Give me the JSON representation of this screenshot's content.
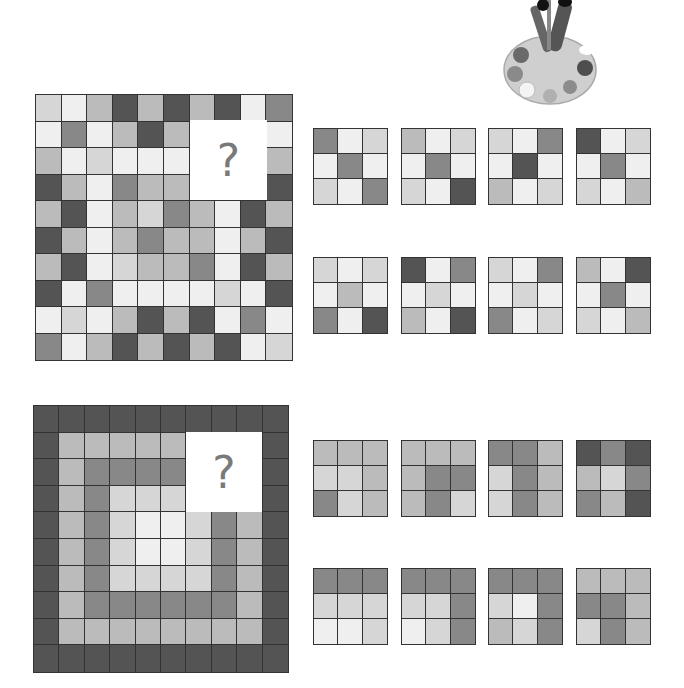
{
  "shades": {
    "L1": "#efefef",
    "L2": "#d6d6d6",
    "L3": "#bbbbbb",
    "L4": "#888888",
    "L5": "#545454"
  },
  "decoration": {
    "icon": "paint-palette-icon"
  },
  "puzzle1": {
    "missing_label": "?",
    "grid": [
      [
        "L2",
        "L1",
        "L3",
        "L5",
        "L3",
        "L5",
        "L3",
        "L5",
        "L1",
        "L4"
      ],
      [
        "L1",
        "L4",
        "L1",
        "L3",
        "L5",
        "L3",
        "Q",
        "Q",
        "Q",
        "L1"
      ],
      [
        "L3",
        "L1",
        "L2",
        "L1",
        "L1",
        "L1",
        "Q",
        "Q",
        "Q",
        "L3"
      ],
      [
        "L5",
        "L3",
        "L1",
        "L4",
        "L3",
        "L3",
        "Q",
        "Q",
        "Q",
        "L5"
      ],
      [
        "L3",
        "L5",
        "L1",
        "L3",
        "L2",
        "L4",
        "L3",
        "L1",
        "L5",
        "L3"
      ],
      [
        "L5",
        "L3",
        "L1",
        "L3",
        "L4",
        "L3",
        "L3",
        "L1",
        "L3",
        "L5"
      ],
      [
        "L3",
        "L5",
        "L1",
        "L2",
        "L3",
        "L3",
        "L4",
        "L1",
        "L5",
        "L3"
      ],
      [
        "L5",
        "L1",
        "L4",
        "L1",
        "L1",
        "L1",
        "L1",
        "L2",
        "L1",
        "L5"
      ],
      [
        "L1",
        "L2",
        "L1",
        "L3",
        "L5",
        "L3",
        "L5",
        "L1",
        "L4",
        "L1"
      ],
      [
        "L4",
        "L1",
        "L3",
        "L5",
        "L3",
        "L5",
        "L3",
        "L5",
        "L1",
        "L2"
      ]
    ],
    "options": [
      [
        [
          "L4",
          "L1",
          "L2"
        ],
        [
          "L1",
          "L4",
          "L1"
        ],
        [
          "L2",
          "L1",
          "L4"
        ]
      ],
      [
        [
          "L3",
          "L1",
          "L2"
        ],
        [
          "L1",
          "L4",
          "L1"
        ],
        [
          "L2",
          "L1",
          "L5"
        ]
      ],
      [
        [
          "L2",
          "L1",
          "L4"
        ],
        [
          "L1",
          "L5",
          "L1"
        ],
        [
          "L3",
          "L1",
          "L2"
        ]
      ],
      [
        [
          "L5",
          "L1",
          "L2"
        ],
        [
          "L1",
          "L4",
          "L1"
        ],
        [
          "L2",
          "L1",
          "L3"
        ]
      ],
      [
        [
          "L2",
          "L1",
          "L2"
        ],
        [
          "L1",
          "L3",
          "L1"
        ],
        [
          "L4",
          "L1",
          "L5"
        ]
      ],
      [
        [
          "L5",
          "L1",
          "L4"
        ],
        [
          "L1",
          "L2",
          "L1"
        ],
        [
          "L3",
          "L1",
          "L5"
        ]
      ],
      [
        [
          "L2",
          "L1",
          "L4"
        ],
        [
          "L1",
          "L2",
          "L1"
        ],
        [
          "L4",
          "L1",
          "L2"
        ]
      ],
      [
        [
          "L3",
          "L1",
          "L5"
        ],
        [
          "L1",
          "L4",
          "L1"
        ],
        [
          "L2",
          "L1",
          "L3"
        ]
      ]
    ]
  },
  "puzzle2": {
    "missing_label": "?",
    "grid": [
      [
        "L5",
        "L5",
        "L5",
        "L5",
        "L5",
        "L5",
        "L5",
        "L5",
        "L5",
        "L5"
      ],
      [
        "L5",
        "L3",
        "L3",
        "L3",
        "L3",
        "L3",
        "Q",
        "Q",
        "Q",
        "L5"
      ],
      [
        "L5",
        "L3",
        "L4",
        "L4",
        "L4",
        "L4",
        "Q",
        "Q",
        "Q",
        "L5"
      ],
      [
        "L5",
        "L3",
        "L4",
        "L2",
        "L2",
        "L2",
        "Q",
        "Q",
        "Q",
        "L5"
      ],
      [
        "L5",
        "L3",
        "L4",
        "L2",
        "L1",
        "L1",
        "L2",
        "L4",
        "L3",
        "L5"
      ],
      [
        "L5",
        "L3",
        "L4",
        "L2",
        "L1",
        "L1",
        "L2",
        "L4",
        "L3",
        "L5"
      ],
      [
        "L5",
        "L3",
        "L4",
        "L2",
        "L2",
        "L2",
        "L2",
        "L4",
        "L3",
        "L5"
      ],
      [
        "L5",
        "L3",
        "L4",
        "L4",
        "L4",
        "L4",
        "L4",
        "L4",
        "L3",
        "L5"
      ],
      [
        "L5",
        "L3",
        "L3",
        "L3",
        "L3",
        "L3",
        "L3",
        "L3",
        "L3",
        "L5"
      ],
      [
        "L5",
        "L5",
        "L5",
        "L5",
        "L5",
        "L5",
        "L5",
        "L5",
        "L5",
        "L5"
      ]
    ],
    "options": [
      [
        [
          "L3",
          "L3",
          "L3"
        ],
        [
          "L2",
          "L2",
          "L3"
        ],
        [
          "L4",
          "L2",
          "L3"
        ]
      ],
      [
        [
          "L3",
          "L3",
          "L3"
        ],
        [
          "L3",
          "L4",
          "L4"
        ],
        [
          "L3",
          "L4",
          "L2"
        ]
      ],
      [
        [
          "L4",
          "L4",
          "L3"
        ],
        [
          "L2",
          "L4",
          "L3"
        ],
        [
          "L2",
          "L4",
          "L3"
        ]
      ],
      [
        [
          "L5",
          "L4",
          "L5"
        ],
        [
          "L3",
          "L2",
          "L4"
        ],
        [
          "L4",
          "L3",
          "L5"
        ]
      ],
      [
        [
          "L4",
          "L4",
          "L4"
        ],
        [
          "L2",
          "L2",
          "L2"
        ],
        [
          "L1",
          "L1",
          "L2"
        ]
      ],
      [
        [
          "L4",
          "L4",
          "L4"
        ],
        [
          "L2",
          "L2",
          "L4"
        ],
        [
          "L1",
          "L2",
          "L4"
        ]
      ],
      [
        [
          "L4",
          "L4",
          "L4"
        ],
        [
          "L2",
          "L1",
          "L4"
        ],
        [
          "L3",
          "L2",
          "L4"
        ]
      ],
      [
        [
          "L3",
          "L3",
          "L3"
        ],
        [
          "L4",
          "L4",
          "L3"
        ],
        [
          "L2",
          "L4",
          "L3"
        ]
      ]
    ]
  }
}
